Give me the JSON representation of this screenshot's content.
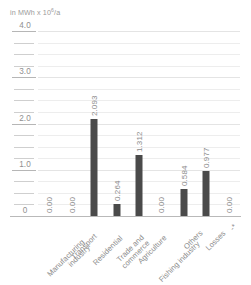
{
  "chart_data": {
    "type": "bar",
    "title": "",
    "subtitle": "",
    "axis_title": "in MWh x 10",
    "axis_title_exponent": "6",
    "axis_title_suffix": "/a",
    "xlabel": "",
    "ylabel": "in MWh x 10^6/a",
    "ylim": [
      0,
      4.0
    ],
    "ytick_labels": [
      "4.0",
      "3.0",
      "2.0",
      "1.0",
      "0"
    ],
    "ytick_values": [
      4.0,
      3.0,
      2.0,
      1.0,
      0
    ],
    "minor_tick_step": 0.25,
    "grid": true,
    "legend": "none",
    "bar_color": "#4a4a4a",
    "grid_color": "#ededed",
    "text_color": "#8b8b8b",
    "categories": [
      "Manufacturing industry",
      "Transport",
      "Residential",
      "Trade and commerce",
      "Agriculture",
      "Fishing industry",
      "Others",
      "Losses",
      "-*"
    ],
    "category_lines": [
      [
        "Manufacturing",
        "industry"
      ],
      [
        "Transport",
        ""
      ],
      [
        "Residential",
        ""
      ],
      [
        "Trade and",
        "commerce"
      ],
      [
        "Agriculture",
        ""
      ],
      [
        "Fishing industry",
        ""
      ],
      [
        "Others",
        ""
      ],
      [
        "Losses",
        ""
      ],
      [
        "-*",
        ""
      ]
    ],
    "values": [
      0.0,
      0.0,
      2.093,
      0.264,
      1.312,
      0.0,
      0.584,
      0.977,
      0.0
    ],
    "value_labels": [
      "0.00",
      "0.00",
      "2.093",
      "0.264",
      "1.312",
      "0.00",
      "0.584",
      "0.977",
      "0.00"
    ]
  }
}
